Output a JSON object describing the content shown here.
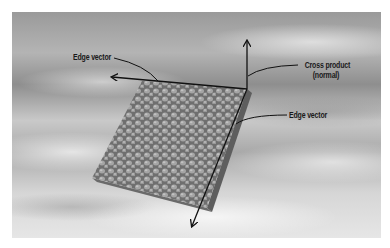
{
  "diagram": {
    "labels": {
      "edge_vector_top": "Edge vector",
      "cross_product_line1": "Cross product",
      "cross_product_line2": "(normal)",
      "edge_vector_right": "Edge vector"
    },
    "colors": {
      "arrow": "#111111",
      "tile": "#8a8a8a",
      "tile_edge": "#5e5e5e",
      "background_dark": "#8e8e8e",
      "background_light": "#e6e6e6"
    },
    "elements": [
      {
        "name": "textured-tile",
        "description": "cobblestone-textured square tile in perspective"
      },
      {
        "name": "edge-vector-left-arrow",
        "from": [
          247,
          89
        ],
        "to": [
          111,
          77
        ]
      },
      {
        "name": "normal-vector-up-arrow",
        "from": [
          247,
          89
        ],
        "to": [
          247,
          40
        ]
      },
      {
        "name": "edge-vector-down-arrow",
        "from": [
          247,
          89
        ],
        "to": [
          191,
          228
        ]
      }
    ]
  }
}
